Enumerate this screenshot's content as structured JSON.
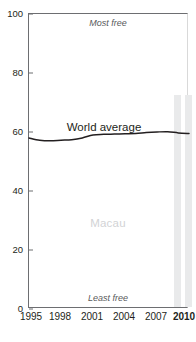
{
  "chart_data": {
    "type": "line",
    "title": "Economic freedom",
    "xlabel": "",
    "ylabel": "",
    "xlim": [
      1995,
      2010
    ],
    "ylim": [
      0,
      100
    ],
    "grid": false,
    "legend_position": "inline",
    "y_ticks": [
      0,
      20,
      40,
      60,
      80,
      100
    ],
    "x_ticks": [
      1995,
      1998,
      2001,
      2004,
      2007,
      2010
    ],
    "axis_annotations": {
      "top": "Most free",
      "bottom": "Least free"
    },
    "country_watermark": "Macau",
    "series": [
      {
        "name": "World average",
        "label": "World average",
        "type": "line",
        "color": "#231f20",
        "x": [
          1995,
          1996,
          1997,
          1998,
          1999,
          2000,
          2001,
          2002,
          2003,
          2004,
          2005,
          2006,
          2007,
          2008,
          2009,
          2010
        ],
        "values": [
          58.0,
          57.2,
          57.0,
          57.2,
          57.4,
          58.0,
          59.0,
          59.2,
          59.3,
          59.4,
          59.5,
          59.8,
          60.0,
          60.1,
          59.7,
          59.5
        ]
      },
      {
        "name": "Macau",
        "label": "Macau",
        "type": "bar",
        "color": "#e9eaeb",
        "x": [
          2009,
          2010
        ],
        "values": [
          72.0,
          72.0
        ]
      }
    ]
  },
  "colors": {
    "axis": "#6d6e71",
    "line": "#231f20",
    "bar": "#e9eaeb",
    "watermark": "#d2d3d5",
    "annotation": "#58595b",
    "background": "#ffffff"
  },
  "y_tick_labels": [
    "0",
    "20",
    "40",
    "60",
    "80",
    "100"
  ],
  "x_tick_labels": [
    "1995",
    "1998",
    "2001",
    "2004",
    "2007",
    "2010"
  ],
  "labels": {
    "most_free": "Most free",
    "least_free": "Least free",
    "world_average": "World average",
    "macau": "Macau",
    "title_partial": "Economic freedom"
  }
}
